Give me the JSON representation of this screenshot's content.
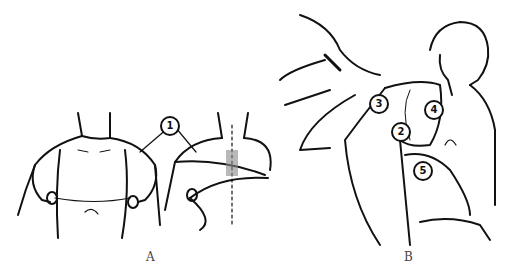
{
  "figure": {
    "panels": [
      {
        "id": "A",
        "label": "A",
        "description": "Figure-of-eight shoulder bandage, front and back view"
      },
      {
        "id": "B",
        "label": "B",
        "description": "Axillary bandage being applied to seated man"
      }
    ],
    "callouts": [
      {
        "number": "1",
        "panel": "A"
      },
      {
        "number": "2",
        "panel": "B"
      },
      {
        "number": "3",
        "panel": "B"
      },
      {
        "number": "4",
        "panel": "B"
      },
      {
        "number": "5",
        "panel": "B"
      }
    ],
    "line_color": "#111111",
    "background": "#ffffff"
  }
}
